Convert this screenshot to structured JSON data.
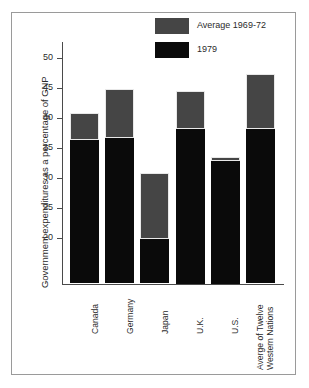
{
  "chart_data": {
    "type": "bar",
    "stacked_style": "overlay",
    "title": "",
    "xlabel": "",
    "ylabel": "Government expenditures as a percentage of GNP",
    "ylim": [
      12.5,
      52
    ],
    "yticks": [
      20,
      25,
      30,
      35,
      40,
      45,
      50
    ],
    "ytick_labels": [
      "20",
      "25",
      "30",
      "35",
      "40",
      "45",
      "50"
    ],
    "grid": false,
    "legend_position": "top-right",
    "categories": [
      "Canada",
      "Germany",
      "Japan",
      "U.K.",
      "U.S.",
      "Averge of Twelve\nWestern Nations"
    ],
    "category_labels": [
      {
        "line1": "Canada",
        "line2": ""
      },
      {
        "line1": "Germany",
        "line2": ""
      },
      {
        "line1": "Japan",
        "line2": ""
      },
      {
        "line1": "U.K.",
        "line2": ""
      },
      {
        "line1": "U.S.",
        "line2": ""
      },
      {
        "line1": "Averge of Twelve",
        "line2": "Western Nations"
      }
    ],
    "series": [
      {
        "name": "Average 1969-72",
        "color": "#454545",
        "values": [
          40.8,
          44.8,
          30.8,
          44.5,
          33.5,
          47.3
        ]
      },
      {
        "name": "1979",
        "color": "#0a0a0a",
        "values": [
          36.3,
          36.7,
          19.9,
          38.2,
          32.9,
          38.2
        ]
      }
    ],
    "legend": [
      {
        "label": "Average 1969-72",
        "swatch": "upper"
      },
      {
        "label": "1979",
        "swatch": "lower"
      }
    ]
  },
  "colors": {
    "upper_series": "#454545",
    "lower_series": "#0a0a0a",
    "axis": "#4a4a4a",
    "frame": "#9a9a9a",
    "text": "#2b2b2b",
    "background": "#ffffff"
  }
}
